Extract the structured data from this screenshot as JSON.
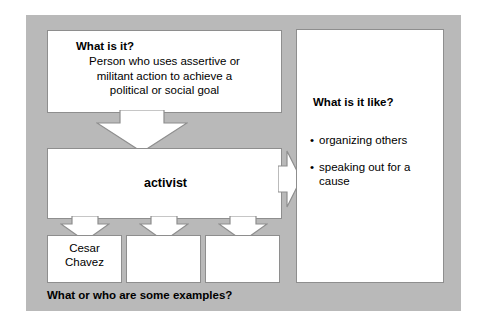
{
  "graphic": {
    "type": "concept-definition-map",
    "background_color": "#b9b9b9",
    "box_fill": "#ffffff",
    "box_border": "#8e8e8e"
  },
  "definition": {
    "question": "What is it?",
    "line1": "Person who uses assertive or",
    "line2": "militant action to achieve a",
    "line3": "political or social goal"
  },
  "term": {
    "label": "activist"
  },
  "attributes": {
    "question": "What is it like?",
    "bullet_glyph": "•",
    "items": [
      "organizing others",
      "speaking out for a cause"
    ]
  },
  "examples": {
    "caption": "What or who are some examples?",
    "boxes": [
      {
        "line1": "Cesar",
        "line2": "Chavez"
      },
      {
        "line1": "",
        "line2": ""
      },
      {
        "line1": "",
        "line2": ""
      }
    ]
  },
  "arrows": {
    "definition_to_term": "arrow-down",
    "term_to_attributes": "arrow-right",
    "term_to_example_1": "arrow-down",
    "term_to_example_2": "arrow-down",
    "term_to_example_3": "arrow-down"
  }
}
